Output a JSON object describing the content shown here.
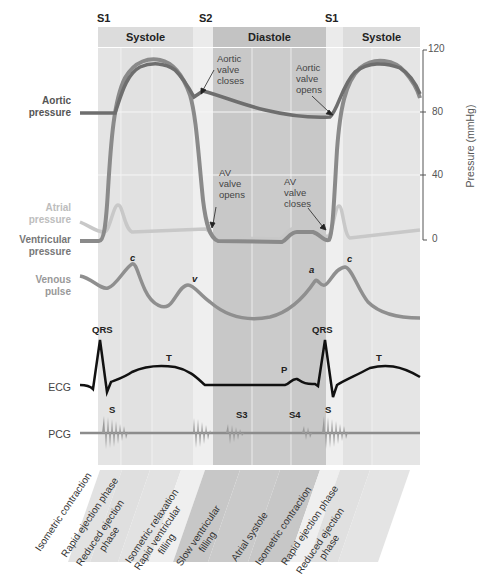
{
  "heart_sounds_top": [
    "S1",
    "S2",
    "S1"
  ],
  "phase_headers": [
    "Systole",
    "Diastole",
    "Systole"
  ],
  "row_labels": {
    "aortic": [
      "Aortic",
      "pressure"
    ],
    "atrial": [
      "Atrial",
      "pressure"
    ],
    "ventricular": [
      "Ventricular",
      "pressure"
    ],
    "venous": [
      "Venous",
      "pulse"
    ],
    "ecg": "ECG",
    "pcg": "PCG"
  },
  "annotations": {
    "aortic_closes": [
      "Aortic",
      "valve",
      "closes"
    ],
    "aortic_opens": [
      "Aortic",
      "valve",
      "opens"
    ],
    "av_opens": [
      "AV",
      "valve",
      "opens"
    ],
    "av_closes": [
      "AV",
      "valve",
      "closes"
    ]
  },
  "axis": {
    "label": "Pressure (mmHg)",
    "ticks": [
      "120",
      "80",
      "40",
      "0"
    ]
  },
  "wave_labels": {
    "venous_c1": "c",
    "venous_v": "v",
    "venous_a": "a",
    "venous_c2": "c",
    "ecg_qrs1": "QRS",
    "ecg_t1": "T",
    "ecg_p": "P",
    "ecg_qrs2": "QRS",
    "ecg_t2": "T",
    "pcg_s1": "S",
    "pcg_s3": "S3",
    "pcg_s4": "S4",
    "pcg_s2": "S"
  },
  "phases": [
    [
      "Isometric contraction"
    ],
    [
      "Rapid ejection phase"
    ],
    [
      "Reduced ejection",
      "phase"
    ],
    [
      "Isometric relaxation"
    ],
    [
      "Rapid ventricular",
      "filling"
    ],
    [
      "Slow ventricular",
      "filling"
    ],
    [
      "Atrial systole"
    ],
    [
      "Isometric contraction"
    ],
    [
      "Rapid ejection phase"
    ],
    [
      "Reduced ejection",
      "phase"
    ]
  ],
  "colors": {
    "systole_bg": "#e3e3e3",
    "diastole_bg": "#c9c9c9",
    "relax_bg": "#eeeeee",
    "aortic_trace": "#6e6e6e",
    "ventricular_trace": "#8a8a8a",
    "atrial_trace": "#c4c4c4",
    "ecg_trace": "#111111",
    "pcg_trace": "#8c8c8c"
  }
}
